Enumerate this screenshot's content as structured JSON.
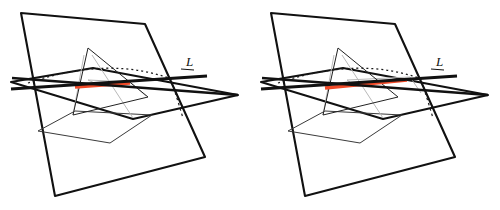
{
  "figure": {
    "width": 500,
    "height": 210,
    "background": "#ffffff",
    "panel_count": 2
  },
  "colors": {
    "stroke_dark": "#111111",
    "stroke_thin": "#3a3a3a",
    "stroke_light": "#b9b9b9",
    "highlight_red": "#f04a28",
    "dotted": "#1a1a1a",
    "background": "#ffffff"
  },
  "strokes": {
    "plane_edge_width": 2.1,
    "line_L_width": 3.2,
    "triangle_width": 1.0,
    "light_width": 1.0,
    "highlight_width": 3.4,
    "dotted_width": 1.3,
    "dash_pattern_dotted": "2 3",
    "dash_pattern_hidden": "2.5 3"
  },
  "panels": [
    {
      "id": "left",
      "name": "panel-left",
      "offset_x": 0,
      "label": {
        "text": "L",
        "x": 186,
        "y": 66,
        "underline": {
          "x1": 181,
          "y1": 69,
          "x2": 194,
          "y2": 70
        }
      },
      "vertical_plane": {
        "name": "vertical-plane",
        "points": "21,13 145,24 205,157 55,196"
      },
      "horizontal_plane": {
        "name": "horizontal-plane",
        "points": "11,82 93,68 238,95 133,119"
      },
      "line_L": {
        "name": "line-L",
        "x1": 11,
        "y1": 89,
        "x2": 207,
        "y2": 76
      },
      "line_L_second": {
        "name": "line-L-secondary",
        "x1": 12,
        "y1": 78,
        "x2": 238,
        "y2": 95
      },
      "highlight_segment": {
        "name": "highlight-segment",
        "x1": 75,
        "y1": 87,
        "x2": 130,
        "y2": 83
      },
      "dotted_arc": {
        "name": "dotted-arc",
        "path": "M 28,83 Q 110,55 174,80"
      },
      "hidden_dashes": [
        {
          "name": "hidden-edge",
          "x1": 172,
          "y1": 82,
          "x2": 183,
          "y2": 118
        }
      ],
      "triangle": {
        "name": "inscribed-triangle",
        "points": "88,48 73,115 148,97"
      },
      "light_lines": [
        {
          "name": "light-edge-1",
          "x1": 88,
          "y1": 80,
          "x2": 130,
          "y2": 82
        },
        {
          "name": "light-edge-2",
          "x1": 88,
          "y1": 80,
          "x2": 101,
          "y2": 86
        },
        {
          "name": "light-edge-3",
          "x1": 130,
          "y1": 82,
          "x2": 146,
          "y2": 96
        },
        {
          "name": "light-edge-4",
          "x1": 84,
          "y1": 55,
          "x2": 73,
          "y2": 115
        },
        {
          "name": "light-edge-5",
          "x1": 92,
          "y1": 55,
          "x2": 133,
          "y2": 118
        }
      ],
      "lower_quad": {
        "name": "lower-quadrilateral",
        "points": "38,131 75,111 152,115 110,143"
      }
    },
    {
      "id": "right",
      "name": "panel-right",
      "offset_x": 250,
      "label": {
        "text": "L",
        "x": 186,
        "y": 66,
        "underline": {
          "x1": 181,
          "y1": 69,
          "x2": 194,
          "y2": 70
        }
      },
      "vertical_plane": {
        "name": "vertical-plane",
        "points": "21,13 145,24 205,157 55,196"
      },
      "horizontal_plane": {
        "name": "horizontal-plane",
        "points": "11,82 93,68 238,95 133,119"
      },
      "line_L": {
        "name": "line-L",
        "x1": 11,
        "y1": 89,
        "x2": 207,
        "y2": 76
      },
      "line_L_second": {
        "name": "line-L-secondary",
        "x1": 12,
        "y1": 78,
        "x2": 238,
        "y2": 95
      },
      "highlight_segment": {
        "name": "highlight-segment",
        "x1": 75,
        "y1": 88,
        "x2": 157,
        "y2": 80
      },
      "dotted_arc": {
        "name": "dotted-arc",
        "path": "M 28,83 Q 110,55 174,80"
      },
      "hidden_dashes": [
        {
          "name": "hidden-edge",
          "x1": 172,
          "y1": 82,
          "x2": 183,
          "y2": 118
        }
      ],
      "triangle": {
        "name": "inscribed-triangle",
        "points": "88,48 73,115 148,97"
      },
      "light_lines": [
        {
          "name": "light-edge-1",
          "x1": 97,
          "y1": 80,
          "x2": 160,
          "y2": 77
        },
        {
          "name": "light-edge-2",
          "x1": 97,
          "y1": 80,
          "x2": 104,
          "y2": 85
        },
        {
          "name": "light-edge-3",
          "x1": 160,
          "y1": 77,
          "x2": 171,
          "y2": 93
        },
        {
          "name": "light-edge-4",
          "x1": 84,
          "y1": 55,
          "x2": 73,
          "y2": 115
        },
        {
          "name": "light-edge-5",
          "x1": 92,
          "y1": 55,
          "x2": 133,
          "y2": 118
        }
      ],
      "lower_quad": {
        "name": "lower-quadrilateral",
        "points": "38,131 75,111 152,115 110,143"
      }
    }
  ]
}
